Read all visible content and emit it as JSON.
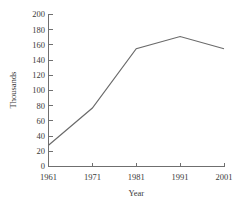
{
  "chart_data": {
    "type": "line",
    "title": "",
    "xlabel": "Year",
    "ylabel": "Thousands",
    "x": [
      1961,
      1971,
      1981,
      1991,
      2001
    ],
    "values": [
      28,
      77,
      155,
      171,
      155
    ],
    "series": [
      {
        "name": "",
        "values": [
          28,
          77,
          155,
          171,
          155
        ]
      }
    ],
    "categories": [
      "1961",
      "1971",
      "1981",
      "1991",
      "2001"
    ],
    "xlim": [
      1961,
      2001
    ],
    "ylim": [
      0,
      200
    ],
    "y_ticks": [
      0,
      20,
      40,
      60,
      80,
      100,
      120,
      140,
      160,
      180,
      200
    ],
    "y_tick_labels": [
      "0",
      "20",
      "40",
      "60",
      "80",
      "100",
      "120",
      "140",
      "160",
      "180",
      "200"
    ],
    "x_ticks": [
      1961,
      1971,
      1981,
      1991,
      2001
    ],
    "x_tick_labels": [
      "1961",
      "1971",
      "1981",
      "1991",
      "2001"
    ],
    "grid": false,
    "legend": false,
    "legend_position": "none",
    "line_color": "#6a6a6a",
    "axis_color": "#6f6f6f",
    "background_color": "#ffffff"
  }
}
